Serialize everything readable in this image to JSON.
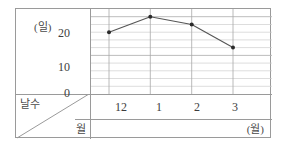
{
  "chart_data": {
    "type": "line",
    "title": "",
    "xlabel": "(월)",
    "ylabel": "(일)",
    "categories": [
      "12",
      "1",
      "2",
      "3"
    ],
    "values": [
      16,
      20,
      18,
      12
    ],
    "series": [
      {
        "name": "날수",
        "values": [
          16,
          20,
          18,
          12
        ]
      }
    ],
    "ylim": [
      0,
      22
    ],
    "y_ticks": [
      "0",
      "10",
      "20"
    ],
    "y_tick_values": [
      0,
      10,
      20
    ],
    "y_minor_step": 2,
    "x_ticks": [
      "12",
      "1",
      "2",
      "3"
    ],
    "grid": true,
    "legend": "none",
    "marker": "filled-circle",
    "line_color": "#555555",
    "grid_color": "#cfcfcf",
    "axis_color": "#9a9a9a"
  },
  "axes": {
    "y_unit_label": "(일)",
    "x_unit_label": "(월)",
    "y_tick_20": "20",
    "y_tick_10": "10",
    "y_tick_0": "0",
    "x_tick_0": "12",
    "x_tick_1": "1",
    "x_tick_2": "2",
    "x_tick_3": "3"
  },
  "corner": {
    "top_label": "날수",
    "bottom_label": "월"
  }
}
